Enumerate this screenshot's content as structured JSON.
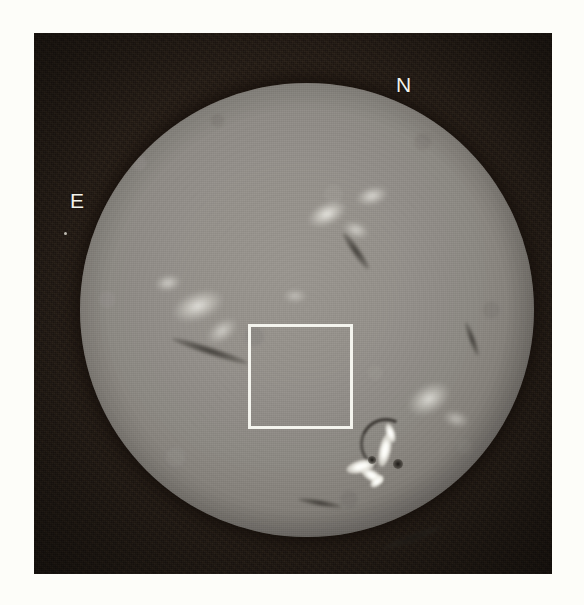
{
  "image": {
    "kind": "solar-h-alpha-full-disk-photograph",
    "width": 584,
    "height": 605,
    "page_background_color": "#fdfdf9",
    "plate_background_color": "#1d1610",
    "plate": {
      "x": 34,
      "y": 33,
      "width": 518,
      "height": 541
    }
  },
  "solar_disk": {
    "center_x": 306,
    "center_y": 310,
    "diameter": 454,
    "surface_color": "#96928c",
    "limb_color": "#46433f"
  },
  "annotations": {
    "orientation_labels": [
      {
        "name": "north",
        "text": "N",
        "x": 396,
        "y": 74
      },
      {
        "name": "east",
        "text": "E",
        "x": 70,
        "y": 190
      }
    ],
    "roi_box": {
      "label": "active-region-box",
      "color": "#f4f4ee",
      "x": 248,
      "y": 324,
      "width": 105,
      "height": 105,
      "border_width": 3
    },
    "speck": {
      "x": 64,
      "y": 232
    }
  },
  "features": {
    "plages": [
      {
        "name": "plage-north-east-quadrant",
        "cx": 247,
        "cy": 131,
        "rx": 20,
        "ry": 11,
        "rot": -25,
        "intensity": 0.95
      },
      {
        "name": "plage-north-central",
        "cx": 292,
        "cy": 113,
        "rx": 16,
        "ry": 9,
        "rot": -15,
        "intensity": 0.8
      },
      {
        "name": "plage-north-upper",
        "cx": 276,
        "cy": 147,
        "rx": 13,
        "ry": 8,
        "rot": 20,
        "intensity": 0.7
      },
      {
        "name": "plage-east-large",
        "cx": 118,
        "cy": 223,
        "rx": 26,
        "ry": 14,
        "rot": -20,
        "intensity": 0.85
      },
      {
        "name": "plage-east-small",
        "cx": 88,
        "cy": 200,
        "rx": 13,
        "ry": 8,
        "rot": -10,
        "intensity": 0.7
      },
      {
        "name": "plage-east-lower",
        "cx": 142,
        "cy": 248,
        "rx": 17,
        "ry": 10,
        "rot": -35,
        "intensity": 0.65
      },
      {
        "name": "plage-west-of-flare",
        "cx": 349,
        "cy": 316,
        "rx": 22,
        "ry": 14,
        "rot": -30,
        "intensity": 0.8
      },
      {
        "name": "plage-south-west",
        "cx": 376,
        "cy": 336,
        "rx": 13,
        "ry": 8,
        "rot": 15,
        "intensity": 0.55
      },
      {
        "name": "plage-near-centre",
        "cx": 215,
        "cy": 213,
        "rx": 12,
        "ry": 7,
        "rot": 0,
        "intensity": 0.5
      }
    ],
    "filaments": [
      {
        "name": "filament-north-central",
        "cx": 276,
        "cy": 168,
        "rx": 22,
        "ry": 4,
        "rot": 55
      },
      {
        "name": "filament-east-long",
        "cx": 130,
        "cy": 268,
        "rx": 40,
        "ry": 4,
        "rot": 18
      },
      {
        "name": "filament-south-west",
        "cx": 332,
        "cy": 455,
        "rx": 32,
        "ry": 4,
        "rot": -20
      },
      {
        "name": "filament-south-central",
        "cx": 240,
        "cy": 420,
        "rx": 22,
        "ry": 3,
        "rot": 10
      },
      {
        "name": "filament-west-limb",
        "cx": 392,
        "cy": 256,
        "rx": 18,
        "ry": 3,
        "rot": 70
      }
    ],
    "active_region": {
      "name": "two-ribbon-flare",
      "ribbons": [
        {
          "cx": 281,
          "cy": 383,
          "w": 30,
          "h": 13,
          "rot": -15
        },
        {
          "cx": 292,
          "cy": 392,
          "w": 24,
          "h": 11,
          "rot": 30
        },
        {
          "cx": 305,
          "cy": 367,
          "w": 12,
          "h": 34,
          "rot": 12
        },
        {
          "cx": 310,
          "cy": 350,
          "w": 9,
          "h": 20,
          "rot": -18
        },
        {
          "cx": 297,
          "cy": 398,
          "w": 16,
          "h": 9,
          "rot": -40
        }
      ],
      "dark_arc": {
        "cx": 303,
        "cy": 358,
        "r": 23,
        "rot": -20
      },
      "sunspots": [
        {
          "cx": 292,
          "cy": 377,
          "r": 4
        },
        {
          "cx": 318,
          "cy": 381,
          "r": 5
        }
      ]
    }
  }
}
